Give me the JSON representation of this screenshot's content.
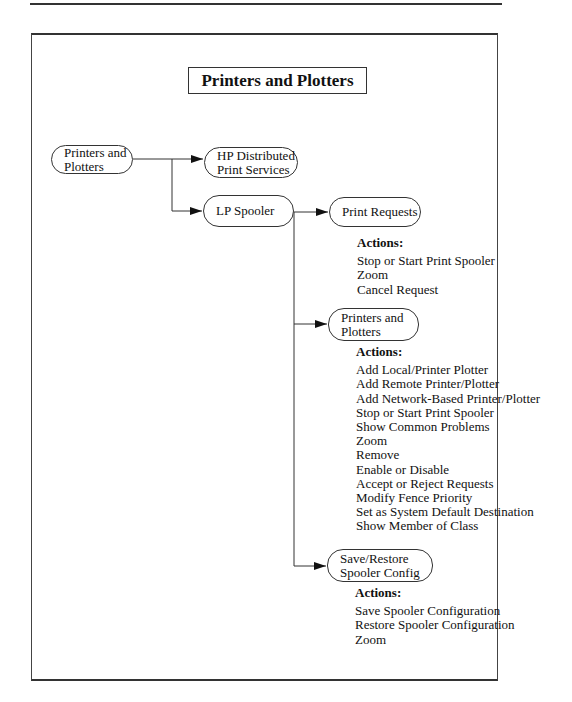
{
  "title": "Printers and Plotters",
  "root": {
    "lines": [
      "Printers and",
      "Plotters"
    ]
  },
  "children": [
    {
      "id": "hp",
      "lines": [
        "HP Distributed",
        "Print Services"
      ]
    },
    {
      "id": "lp",
      "lines": [
        "LP Spooler"
      ]
    }
  ],
  "lp_children": [
    {
      "lines": [
        "Print Requests"
      ],
      "actions_header": "Actions:",
      "actions": [
        "Stop or Start Print Spooler",
        "Zoom",
        "Cancel Request"
      ]
    },
    {
      "lines": [
        "Printers and",
        "Plotters"
      ],
      "actions_header": "Actions:",
      "actions": [
        "Add Local/Printer Plotter",
        "Add Remote Printer/Plotter",
        "Add Network-Based Printer/Plotter",
        "Stop or Start Print Spooler",
        "Show Common Problems",
        "Zoom",
        "Remove",
        "Enable or Disable",
        "Accept or Reject Requests",
        "Modify Fence Priority",
        "Set as System Default Destination",
        "Show Member of Class"
      ]
    },
    {
      "lines": [
        "Save/Restore",
        "Spooler Config"
      ],
      "actions_header": "Actions:",
      "actions": [
        "Save Spooler Configuration",
        "Restore Spooler Configuration",
        "Zoom"
      ]
    }
  ]
}
